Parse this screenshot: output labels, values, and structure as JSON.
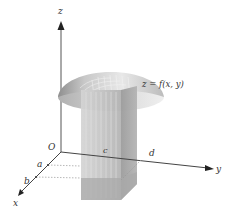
{
  "diagram": {
    "surface_label": "z = f(x, y)",
    "axes": {
      "x": "x",
      "y": "y",
      "z": "z"
    },
    "origin_label": "O",
    "x_ticks": [
      "a",
      "b"
    ],
    "y_ticks": [
      "c",
      "d"
    ],
    "colors": {
      "axis": "#444444",
      "solid_light": "#d8d8d8",
      "solid_mid": "#bdbdbd",
      "solid_dark": "#9a9a9a",
      "base_shadow": "#a8a8a8",
      "cap_light": "#e6e6e6",
      "cap_dark": "#a0a0a0"
    }
  }
}
